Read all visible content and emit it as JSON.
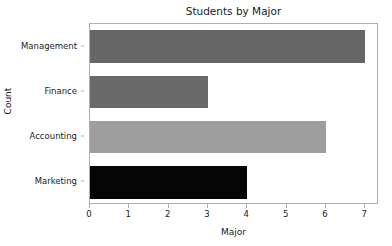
{
  "chart_data": {
    "type": "bar",
    "orientation": "horizontal",
    "title": "Students by Major",
    "xlabel": "Major",
    "ylabel": "Count",
    "categories": [
      "Management",
      "Finance",
      "Accounting",
      "Marketing"
    ],
    "values": [
      7,
      3,
      6,
      4
    ],
    "bar_colors": [
      "#666666",
      "#6a6a6a",
      "#9e9e9e",
      "#050505"
    ],
    "xlim": [
      0,
      7.35
    ],
    "xticks": [
      0,
      1,
      2,
      3,
      4,
      5,
      6,
      7
    ],
    "xtick_labels": [
      "0",
      "1",
      "2",
      "3",
      "4",
      "5",
      "6",
      "7"
    ],
    "grid": false,
    "legend": false,
    "series": [
      {
        "name": "Count",
        "points": [
          {
            "category": "Management",
            "value": 7,
            "color": "#666666"
          },
          {
            "category": "Finance",
            "value": 3,
            "color": "#6a6a6a"
          },
          {
            "category": "Accounting",
            "value": 6,
            "color": "#9e9e9e"
          },
          {
            "category": "Marketing",
            "value": 4,
            "color": "#050505"
          }
        ]
      }
    ]
  },
  "figure": {
    "background": "#ffffff",
    "spine_color": "#b0b0b0",
    "text_color": "#1a1a1a"
  }
}
